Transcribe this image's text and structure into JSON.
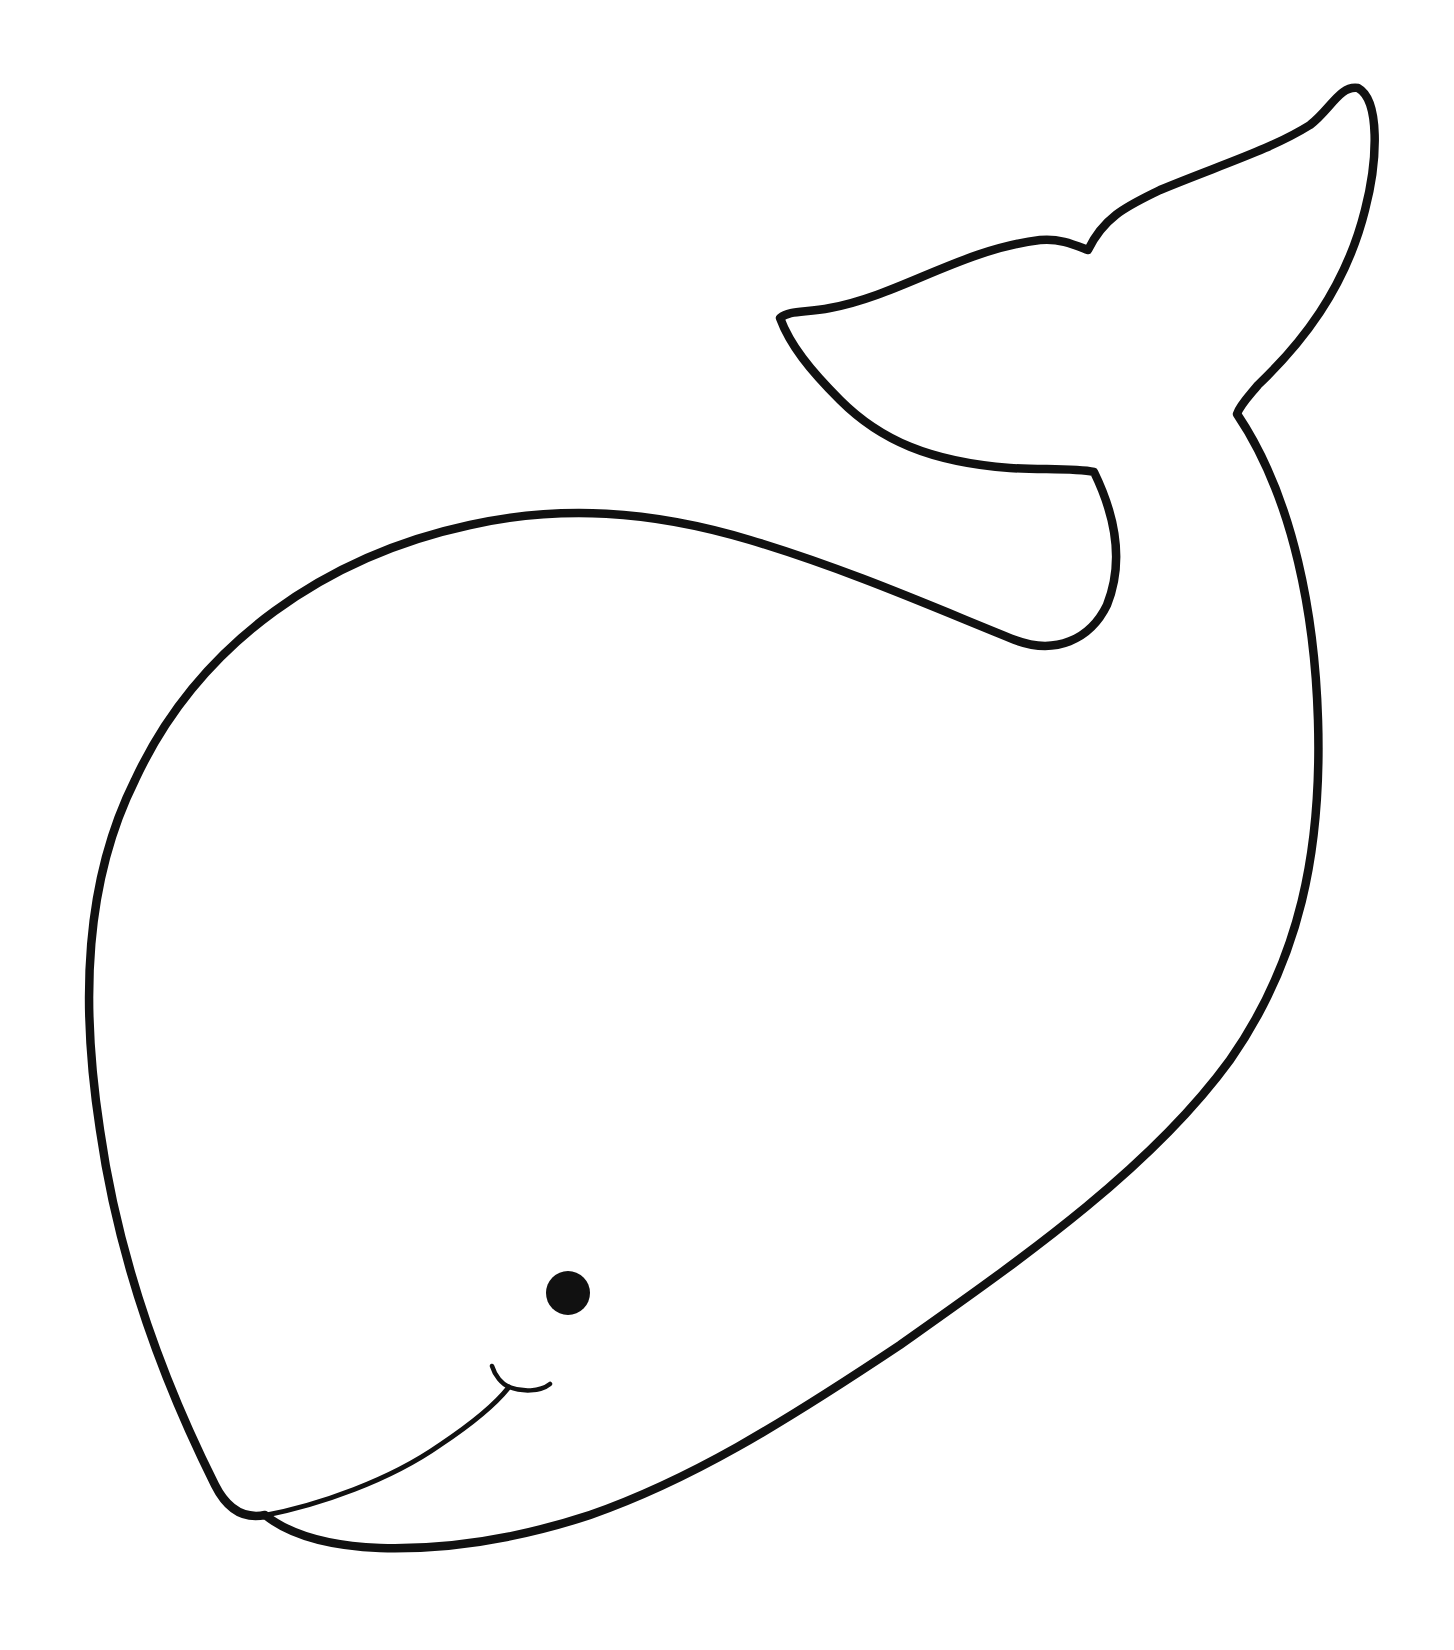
{
  "drawing": {
    "subject": "whale",
    "style": "line-art coloring page",
    "stroke_color": "#111111",
    "fill_color": "#ffffff",
    "background": "#ffffff",
    "parts": [
      "body-outline",
      "tail-fluke",
      "eye",
      "mouth",
      "mouth-dimple"
    ]
  }
}
